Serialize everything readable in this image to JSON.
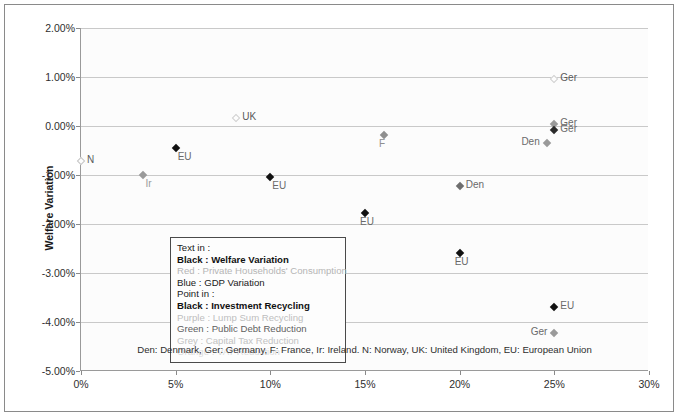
{
  "chart_data": {
    "type": "scatter",
    "title": "",
    "xlabel": "",
    "ylabel": "Welfare Variation",
    "xlim": [
      0,
      30
    ],
    "ylim": [
      -5,
      2
    ],
    "x_unit": "%",
    "y_unit": "%",
    "grid": true,
    "legend_position": "inside-left",
    "xticks": [
      "0%",
      "5%",
      "10%",
      "15%",
      "20%",
      "25%",
      "30%"
    ],
    "xtick_values": [
      0,
      5,
      10,
      15,
      20,
      25,
      30
    ],
    "yticks": [
      "2.00%",
      "1.00%",
      "0.00%",
      "-1.00%",
      "-2.00%",
      "-3.00%",
      "-4.00%",
      "-5.00%"
    ],
    "ytick_values": [
      2,
      1,
      0,
      -1,
      -2,
      -3,
      -4,
      -5
    ],
    "points": [
      {
        "label": "N",
        "x": 0.0,
        "y": -0.72,
        "color": "#c4c4c4",
        "style": "hollow",
        "label_pos": "right"
      },
      {
        "label": "Ir",
        "x": 3.3,
        "y": -1.0,
        "color": "#9a9a9a",
        "style": "filled",
        "label_pos": "below-right"
      },
      {
        "label": "EU",
        "x": 5.0,
        "y": -0.45,
        "color": "#111111",
        "style": "filled",
        "label_pos": "below-right"
      },
      {
        "label": "UK",
        "x": 8.2,
        "y": 0.17,
        "color": "#d0d0d0",
        "style": "hollow",
        "label_pos": "right"
      },
      {
        "label": "EU",
        "x": 10.0,
        "y": -1.05,
        "color": "#111111",
        "style": "filled",
        "label_pos": "below-right"
      },
      {
        "label": "EU",
        "x": 15.0,
        "y": -1.78,
        "color": "#111111",
        "style": "filled",
        "label_pos": "below"
      },
      {
        "label": "F",
        "x": 16.0,
        "y": -0.18,
        "color": "#8f8f8f",
        "style": "filled",
        "label_pos": "below"
      },
      {
        "label": "Den",
        "x": 20.0,
        "y": -1.22,
        "color": "#6e6e6e",
        "style": "filled",
        "label_pos": "right"
      },
      {
        "label": "EU",
        "x": 20.0,
        "y": -2.6,
        "color": "#111111",
        "style": "filled",
        "label_pos": "below"
      },
      {
        "label": "Ger",
        "x": 25.0,
        "y": 0.95,
        "color": "#d0d0d0",
        "style": "hollow",
        "label_pos": "right"
      },
      {
        "label": "Ger",
        "x": 25.0,
        "y": 0.05,
        "color": "#9a9a9a",
        "style": "filled",
        "label_pos": "right"
      },
      {
        "label": "Ger",
        "x": 25.0,
        "y": -0.08,
        "color": "#2a2a2a",
        "style": "filled",
        "label_pos": "right"
      },
      {
        "label": "Den",
        "x": 24.6,
        "y": -0.35,
        "color": "#9a9a9a",
        "style": "filled",
        "label_pos": "left"
      },
      {
        "label": "EU",
        "x": 25.0,
        "y": -3.7,
        "color": "#111111",
        "style": "filled",
        "label_pos": "right"
      },
      {
        "label": "Ger",
        "x": 25.0,
        "y": -4.22,
        "color": "#9a9a9a",
        "style": "filled",
        "label_pos": "left"
      }
    ]
  },
  "legend": {
    "lines": [
      {
        "text": "Text in :",
        "color": "#1a1a1a",
        "bold": false
      },
      {
        "text": "Black : Welfare Variation",
        "color": "#111111",
        "bold": true
      },
      {
        "text": "Red : Private Households' Consumption",
        "color": "#b5b5b5",
        "bold": false
      },
      {
        "text": "Blue : GDP Variation",
        "color": "#1a1a1a",
        "bold": false
      },
      {
        "text": "Point in :",
        "color": "#1a1a1a",
        "bold": false
      },
      {
        "text": "Black : Investment Recycling",
        "color": "#111111",
        "bold": true
      },
      {
        "text": "Purple : Lump Sum Recycling",
        "color": "#bdbdbd",
        "bold": false
      },
      {
        "text": "Green : Public Debt Reduction",
        "color": "#5f5f5f",
        "bold": false
      },
      {
        "text": "Grey : Capital Tax Reduction",
        "color": "#c2c2c2",
        "bold": false
      },
      {
        "text": "Orange : VAT Reduction",
        "color": "#dcdcdc",
        "bold": false
      }
    ]
  },
  "footnote": {
    "text": "Den: Denmark, Ger: Germany, F: France, Ir: Ireland. N: Norway, UK: United Kingdom, EU: European Union"
  }
}
